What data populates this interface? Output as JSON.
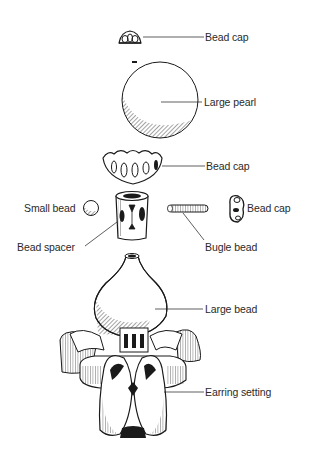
{
  "diagram": {
    "type": "exploded-view illustration",
    "colors": {
      "ink": "#1a1a1a",
      "background": "#ffffff",
      "text": "#2a2a2a"
    },
    "labels": [
      {
        "id": "bead-cap-top",
        "text": "Bead cap"
      },
      {
        "id": "large-pearl",
        "text": "Large pearl"
      },
      {
        "id": "bead-cap-middle",
        "text": "Bead cap"
      },
      {
        "id": "small-bead",
        "text": "Small bead"
      },
      {
        "id": "bead-cap-right",
        "text": "Bead cap"
      },
      {
        "id": "bead-spacer",
        "text": "Bead spacer"
      },
      {
        "id": "bugle-bead",
        "text": "Bugle bead"
      },
      {
        "id": "large-bead",
        "text": "Large bead"
      },
      {
        "id": "earring-setting",
        "text": "Earring setting"
      }
    ]
  }
}
